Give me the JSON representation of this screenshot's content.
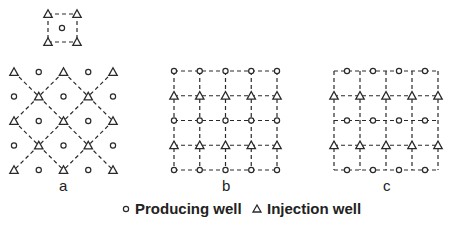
{
  "diagram": {
    "type": "well-pattern-schematic",
    "colors": {
      "stroke": "#2a2a2a",
      "background": "#ffffff"
    },
    "inset": {
      "description": "five-spot unit",
      "injection_wells": [
        [
          48,
          14
        ],
        [
          77,
          14
        ],
        [
          48,
          42
        ],
        [
          77,
          42
        ]
      ],
      "producing_wells": [
        [
          62,
          28
        ]
      ]
    },
    "panels": [
      {
        "label": "a",
        "label_pos": [
          60,
          178
        ],
        "grid": "diagonal",
        "rows": [
          [
            "I",
            "P",
            "I",
            "P",
            "I"
          ],
          [
            "P",
            "I",
            "P",
            "I",
            "P"
          ],
          [
            "I",
            "P",
            "I",
            "P",
            "I"
          ],
          [
            "P",
            "I",
            "P",
            "I",
            "P"
          ],
          [
            "I",
            "P",
            "I",
            "P",
            "I"
          ]
        ],
        "origin": [
          14,
          72
        ],
        "spacing": [
          24.75,
          24.5
        ]
      },
      {
        "label": "b",
        "label_pos": [
          222,
          178
        ],
        "grid": "square",
        "rows": [
          [
            "P",
            "P",
            "P",
            "P",
            "P"
          ],
          [
            "I",
            "I",
            "I",
            "I",
            "I"
          ],
          [
            "P",
            "P",
            "P",
            "P",
            "P"
          ],
          [
            "I",
            "I",
            "I",
            "I",
            "I"
          ],
          [
            "P",
            "P",
            "P",
            "P",
            "P"
          ]
        ],
        "origin": [
          174,
          71
        ],
        "spacing": [
          25.75,
          24.75
        ]
      },
      {
        "label": "c",
        "label_pos": [
          382,
          178
        ],
        "grid": "square-offset",
        "injection_rows": [
          1,
          3
        ],
        "producing_rows_midpoints": [
          0,
          2,
          4
        ],
        "columns": 5,
        "origin": [
          334,
          71
        ],
        "spacing": [
          26,
          24.75
        ]
      }
    ],
    "legend": {
      "producing": {
        "label": "Producing well",
        "symbol": "circle"
      },
      "injection": {
        "label": "Injection well",
        "symbol": "triangle"
      }
    }
  }
}
